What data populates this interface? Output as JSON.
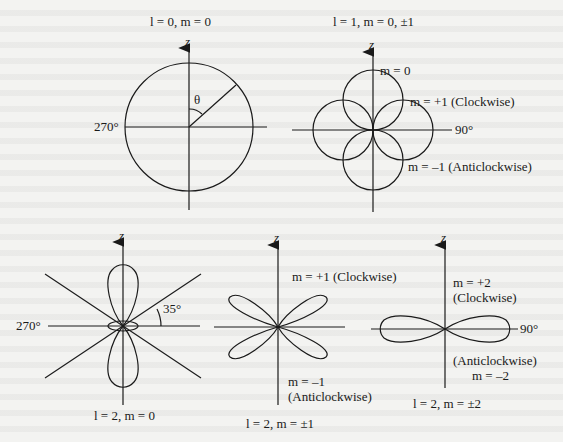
{
  "figure": {
    "axis_label": "z",
    "diagrams": [
      {
        "id": "l0",
        "caption": "l = 0, m = 0",
        "angle_labels": {
          "left": "270°",
          "theta": "θ"
        },
        "shape": "circle"
      },
      {
        "id": "l1",
        "caption": "l = 1, m = 0, ±1",
        "angle_labels": {
          "right": "90°"
        },
        "lobe_labels": [
          "m = 0",
          "m = +1 (Clockwise)",
          "m = –1 (Anticlockwise)"
        ],
        "shape": "four-lobe (p)"
      },
      {
        "id": "l2m0",
        "caption": "l = 2, m = 0",
        "angle_labels": {
          "left": "270°",
          "cone": "35°"
        },
        "shape": "d-z² (two vertical lobes + small ring)"
      },
      {
        "id": "l2m1",
        "caption": "l = 2, m = ±1",
        "lobe_labels": [
          "m = +1 (Clockwise)",
          "m = –1",
          "(Anticlockwise)"
        ],
        "shape": "four diagonal lobes"
      },
      {
        "id": "l2m2",
        "caption": "l = 2, m = ±2",
        "angle_labels": {
          "right": "90°"
        },
        "lobe_labels": [
          "m = +2",
          "(Clockwise)",
          "(Anticlockwise)",
          "m = –2"
        ],
        "shape": "two horizontal lobes"
      }
    ]
  }
}
